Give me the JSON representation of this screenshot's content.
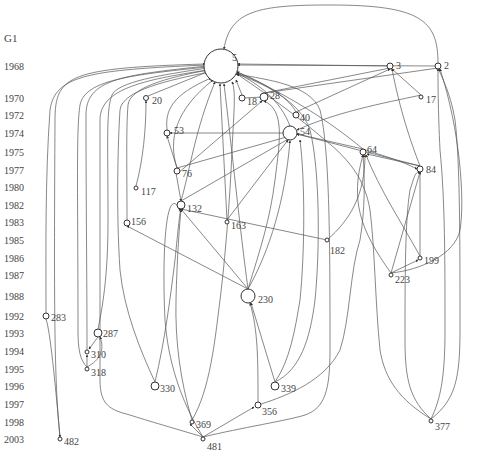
{
  "graph": {
    "title": "G1",
    "years": [
      {
        "label": "1968",
        "y": 66
      },
      {
        "label": "1970",
        "y": 98
      },
      {
        "label": "1972",
        "y": 115
      },
      {
        "label": "1974",
        "y": 133
      },
      {
        "label": "1975",
        "y": 152
      },
      {
        "label": "1977",
        "y": 170
      },
      {
        "label": "1980",
        "y": 187
      },
      {
        "label": "1982",
        "y": 205
      },
      {
        "label": "1983",
        "y": 222
      },
      {
        "label": "1985",
        "y": 240
      },
      {
        "label": "1986",
        "y": 258
      },
      {
        "label": "1987",
        "y": 275
      },
      {
        "label": "1988",
        "y": 296
      },
      {
        "label": "1992",
        "y": 316
      },
      {
        "label": "1993",
        "y": 333
      },
      {
        "label": "1994",
        "y": 351
      },
      {
        "label": "1995",
        "y": 369
      },
      {
        "label": "1996",
        "y": 386
      },
      {
        "label": "1997",
        "y": 404
      },
      {
        "label": "1998",
        "y": 422
      },
      {
        "label": "2003",
        "y": 439
      }
    ],
    "nodes": [
      {
        "id": "5",
        "x": 221,
        "y": 66,
        "r": 17,
        "lx": 232,
        "ly": 58
      },
      {
        "id": "3",
        "x": 390,
        "y": 66,
        "r": 3,
        "lx": 396,
        "ly": 66
      },
      {
        "id": "2",
        "x": 438,
        "y": 66,
        "r": 3,
        "lx": 444,
        "ly": 66
      },
      {
        "id": "20",
        "x": 146,
        "y": 98,
        "r": 2.5,
        "lx": 152,
        "ly": 101
      },
      {
        "id": "18",
        "x": 242,
        "y": 98,
        "r": 3,
        "lx": 247,
        "ly": 102
      },
      {
        "id": "28",
        "x": 264,
        "y": 97,
        "r": 4,
        "lx": 270,
        "ly": 96
      },
      {
        "id": "17",
        "x": 421,
        "y": 97,
        "r": 2,
        "lx": 426,
        "ly": 100
      },
      {
        "id": "40",
        "x": 296,
        "y": 115,
        "r": 3,
        "lx": 300,
        "ly": 118
      },
      {
        "id": "53",
        "x": 167,
        "y": 133,
        "r": 3,
        "lx": 174,
        "ly": 131
      },
      {
        "id": "54",
        "x": 290,
        "y": 133,
        "r": 7,
        "lx": 300,
        "ly": 132
      },
      {
        "id": "64",
        "x": 363,
        "y": 152,
        "r": 3,
        "lx": 367,
        "ly": 150
      },
      {
        "id": "76",
        "x": 177,
        "y": 171,
        "r": 3,
        "lx": 182,
        "ly": 174
      },
      {
        "id": "84",
        "x": 420,
        "y": 169,
        "r": 3,
        "lx": 426,
        "ly": 170
      },
      {
        "id": "117",
        "x": 136,
        "y": 188,
        "r": 2,
        "lx": 141,
        "ly": 192
      },
      {
        "id": "132",
        "x": 181,
        "y": 205,
        "r": 4,
        "lx": 187,
        "ly": 209
      },
      {
        "id": "163",
        "x": 227,
        "y": 222,
        "r": 2,
        "lx": 231,
        "ly": 226
      },
      {
        "id": "156",
        "x": 127,
        "y": 223,
        "r": 3,
        "lx": 131,
        "ly": 222
      },
      {
        "id": "182",
        "x": 327,
        "y": 240,
        "r": 2,
        "lx": 330,
        "ly": 251
      },
      {
        "id": "199",
        "x": 420,
        "y": 258,
        "r": 2,
        "lx": 424,
        "ly": 261
      },
      {
        "id": "223",
        "x": 391,
        "y": 275,
        "r": 2,
        "lx": 395,
        "ly": 280
      },
      {
        "id": "230",
        "x": 248,
        "y": 296,
        "r": 7,
        "lx": 258,
        "ly": 300
      },
      {
        "id": "283",
        "x": 46,
        "y": 316,
        "r": 3,
        "lx": 51,
        "ly": 318
      },
      {
        "id": "287",
        "x": 98,
        "y": 333,
        "r": 4,
        "lx": 103,
        "ly": 334
      },
      {
        "id": "310",
        "x": 87,
        "y": 352,
        "r": 2,
        "lx": 91,
        "ly": 355
      },
      {
        "id": "318",
        "x": 87,
        "y": 369,
        "r": 2,
        "lx": 91,
        "ly": 373
      },
      {
        "id": "330",
        "x": 155,
        "y": 386,
        "r": 4,
        "lx": 160,
        "ly": 389
      },
      {
        "id": "339",
        "x": 275,
        "y": 386,
        "r": 4,
        "lx": 281,
        "ly": 389
      },
      {
        "id": "356",
        "x": 258,
        "y": 405,
        "r": 3,
        "lx": 262,
        "ly": 412
      },
      {
        "id": "369",
        "x": 192,
        "y": 422,
        "r": 2,
        "lx": 196,
        "ly": 425
      },
      {
        "id": "377",
        "x": 431,
        "y": 421,
        "r": 2,
        "lx": 435,
        "ly": 427
      },
      {
        "id": "481",
        "x": 203,
        "y": 439,
        "r": 2,
        "lx": 207,
        "ly": 447
      },
      {
        "id": "482",
        "x": 60,
        "y": 439,
        "r": 2,
        "lx": 64,
        "ly": 442
      }
    ],
    "edges": [
      "M 438 63 C 438 20, 420 5, 330 5 C 260 5, 230 10, 224 49",
      "M 390 66 L 238 64",
      "M 438 66 L 238 65",
      "M 60 437 C 54 380, 54 300, 55 120 C 55 75, 70 68, 205 64",
      "M 46 313 C 46 250, 45 180, 50 110 C 55 75, 90 70, 206 65",
      "M 87 350 C 87 280, 86 200, 86 115 C 86 80, 120 75, 207 66",
      "M 87 367 C 80 360, 78 350, 78 330 C 78 200, 76 130, 80 105 C 85 80, 130 75, 207 67",
      "M 98 329 C 104 300, 108 270, 108 220 C 108 140, 106 110, 112 95 C 118 82, 160 75, 208 68",
      "M 127 220 C 127 170, 126 130, 128 105 C 130 88, 165 78, 208 70",
      "M 136 186 C 143 160, 146 130, 146 101",
      "M 148 96 L 207 72",
      "M 155 382 C 140 350, 124 310, 120 270 C 116 210, 118 140, 120 110 C 122 90, 170 80, 209 72",
      "M 167 130 C 165 110, 172 95, 211 78",
      "M 177 168 C 168 140, 175 110, 213 80",
      "M 181 201 C 190 170, 195 130, 215 82",
      "M 227 220 L 220 84",
      "M 248 289 C 240 230, 232 150, 224 84",
      "M 258 402 C 258 360, 258 330, 250 303",
      "M 275 382 L 251 303",
      "M 203 437 L 254 407",
      "M 203 437 L 190 424",
      "M 203 437 C 180 430, 145 420, 130 415 C 110 410, 100 405, 100 380 C 100 300, 100 200, 100 120 C 100 90, 140 80, 208 70",
      "M 203 437 C 240 428, 290 420, 305 415 C 325 408, 330 390, 330 350 C 330 250, 330 150, 320 110 C 310 85, 270 80, 236 74",
      "M 203 437 C 180 400, 168 360, 165 320 C 162 260, 165 180, 180 210",
      "M 192 420 C 180 380, 175 340, 176 300 C 177 260, 179 230, 181 210",
      "M 192 420 C 210 390, 215 340, 220 300 C 225 260, 230 200, 232 150 C 234 110, 236 90, 232 82",
      "M 155 382 C 165 340, 170 300, 175 260 C 178 230, 180 210, 181 209",
      "M 275 382 C 290 360, 295 330, 300 300 C 305 250, 305 180, 300 140",
      "M 275 382 C 300 370, 310 340, 315 300 C 320 250, 320 170, 310 130 C 300 100, 260 82, 237 74",
      "M 258 405 C 290 395, 325 380, 340 350 C 350 320, 350 270, 360 240 C 365 210, 365 180, 363 155",
      "M 248 289 L 127 226",
      "M 248 289 L 181 209",
      "M 248 289 C 270 250, 285 200, 290 141",
      "M 248 289 C 260 250, 270 220, 275 180 C 280 140, 285 110, 264 101",
      "M 431 419 C 400 400, 385 380, 380 350 C 375 300, 375 250, 370 210 C 365 180, 350 160, 325 140 C 290 110, 260 90, 237 74",
      "M 431 419 C 410 400, 405 380, 405 340 C 405 280, 405 220, 410 190 C 415 175, 415 172, 420 172",
      "M 431 419 C 440 400, 445 380, 445 330 C 445 260, 445 200, 440 150 C 438 110, 438 80, 438 69",
      "M 431 419 C 455 400, 460 380, 460 330 C 460 240, 460 160, 455 120 C 450 90, 440 75, 439 69",
      "M 391 273 L 420 172",
      "M 391 273 C 360 230, 350 200, 363 155",
      "M 391 273 L 418 260",
      "M 391 273 C 420 270, 455 255, 460 230 C 465 200, 460 130, 440 69",
      "M 420 256 L 420 172",
      "M 420 256 C 400 220, 380 190, 366 155",
      "M 420 166 L 367 154",
      "M 420 166 C 410 140, 400 110, 392 69",
      "M 421 95 L 392 69",
      "M 421 95 C 400 100, 340 110, 297 130",
      "M 327 240 C 350 220, 365 195, 365 155",
      "M 327 240 L 181 209",
      "M 363 149 C 340 130, 300 100, 237 72",
      "M 363 149 L 297 134",
      "M 290 126 C 280 100, 260 85, 237 73",
      "M 296 112 L 390 69",
      "M 296 112 C 290 100, 270 85, 237 72",
      "M 264 93 L 390 68",
      "M 264 93 L 438 68",
      "M 242 95 L 236 80",
      "M 242 98 L 264 97",
      "M 177 168 L 290 136",
      "M 181 201 L 290 138",
      "M 227 220 L 288 140",
      "M 177 174 L 262 101",
      "M 177 168 L 167 136",
      "M 420 166 L 297 134",
      "M 176 173 L 181 201",
      "M 363 149 C 380 155, 400 160, 417 169",
      "M 98 337 L 89 349",
      "M 87 367 C 100 360, 105 350, 100 337",
      "M 87 367 L 87 355",
      "M 46 319 C 50 330, 55 380, 60 437",
      "M 290 133 L 170 133"
    ]
  }
}
